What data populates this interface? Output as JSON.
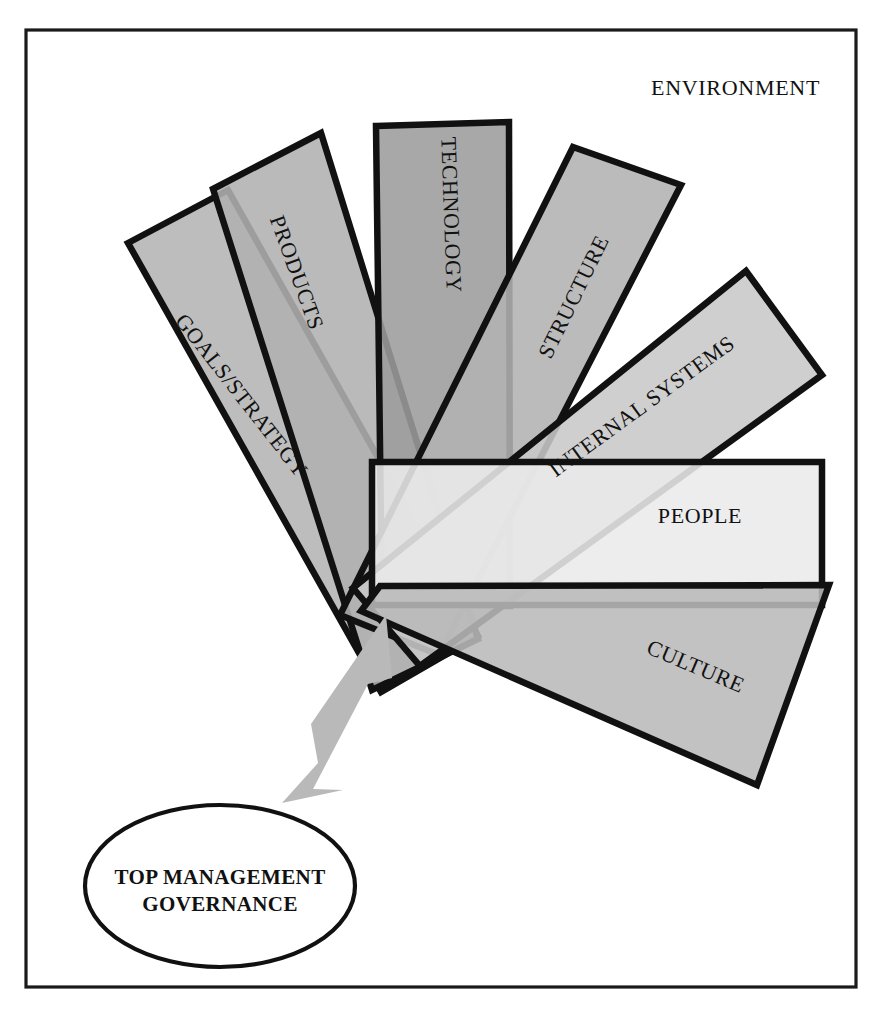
{
  "figure": {
    "title_text": "ENVIRONMENT",
    "frame": {
      "x": 26,
      "y": 30,
      "width": 830,
      "height": 957
    },
    "colors": {
      "frame_stroke": "#1a1a1a",
      "blade_stroke": "#111111",
      "arrow_fill": "#b9b9b9",
      "text": "#111111",
      "background": "#ffffff"
    }
  },
  "chart_data": {
    "type": "diagram",
    "title": "ENVIRONMENT",
    "subtype": "fan-of-overlapping-rectangles",
    "convergence_point": {
      "x": 392,
      "y": 600
    },
    "blade_count": 7,
    "blades": [
      {
        "label": "GOALS/STRATEGY",
        "fill": "#b4b4b4",
        "angle_deg": -51,
        "order": 1,
        "points": "128,243 228,190 478,636 381,692",
        "text_x": 236,
        "text_y": 400,
        "text_rotate": 52
      },
      {
        "label": "PRODUCTS",
        "fill": "#b0b0b0",
        "angle_deg": -24,
        "order": 2,
        "points": "213,189 321,133 478,639 372,690",
        "text_x": 290,
        "text_y": 275,
        "text_rotate": 70
      },
      {
        "label": "TECHNOLOGY",
        "fill": "#9c9c9c",
        "angle_deg": -4,
        "order": 3,
        "points": "376,126 509,122 510,606 382,606",
        "text_x": 444,
        "text_y": 215,
        "text_rotate": 88
      },
      {
        "label": "STRUCTURE",
        "fill": "#b2b2b2",
        "angle_deg": 20,
        "order": 4,
        "points": "573,147 681,185 439,655 340,615",
        "text_x": 580,
        "text_y": 300,
        "text_rotate": -64
      },
      {
        "label": "INTERNAL SYSTEMS",
        "fill": "#c8c8c8",
        "angle_deg": 40,
        "order": 5,
        "points": "746,271 822,375 420,666 353,588",
        "text_x": 646,
        "text_y": 412,
        "text_rotate": -36
      },
      {
        "label": "PEOPLE",
        "fill": "#ebebeb",
        "angle_deg": 0,
        "order": 6,
        "points": "372,462 822,462 822,605 372,605",
        "text_x": 700,
        "text_y": 523,
        "text_rotate": 0
      },
      {
        "label": "CULTURE",
        "fill": "#b9b9b9",
        "angle_deg": 27,
        "order": 7,
        "points": "380,586 829,585 757,785 361,611",
        "text_x": 693,
        "text_y": 673,
        "text_rotate": 23
      }
    ],
    "callout": {
      "label_line1": "TOP MANAGEMENT",
      "label_line2": "GOVERNANCE",
      "ellipse": {
        "cx": 220,
        "cy": 886,
        "rx": 135,
        "ry": 81
      },
      "arrow": {
        "fill": "#b9b9b9",
        "points": "282,803 318,763 311,724 386,615 392,678 368,684 313,789 343,790"
      }
    }
  },
  "labels": {
    "environment": "ENVIRONMENT",
    "goals_strategy": "GOALS/STRATEGY",
    "products": "PRODUCTS",
    "technology": "TECHNOLOGY",
    "structure": "STRUCTURE",
    "internal_systems": "INTERNAL SYSTEMS",
    "people": "PEOPLE",
    "culture": "CULTURE",
    "governance_line1": "TOP MANAGEMENT",
    "governance_line2": "GOVERNANCE"
  }
}
